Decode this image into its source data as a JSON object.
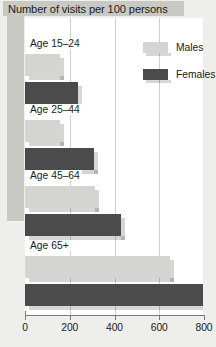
{
  "chart_data": {
    "type": "bar",
    "orientation": "horizontal",
    "title": "Number of visits per 100 persons",
    "xlabel": "",
    "ylabel": "",
    "xlim": [
      0,
      800
    ],
    "xticks": [
      0,
      200,
      400,
      600,
      800
    ],
    "xtick_labels": [
      "0",
      "200",
      "400",
      "600",
      "800"
    ],
    "grid": true,
    "legend_position": "upper right",
    "categories": [
      "Age 15–24",
      "Age 25–44",
      "Age 45–64",
      "Age 65+"
    ],
    "series": [
      {
        "name": "Males",
        "color": "#d4d4d1",
        "values": [
          155,
          155,
          315,
          650
        ]
      },
      {
        "name": "Females",
        "color": "#4b4b4b",
        "values": [
          235,
          310,
          430,
          820
        ]
      }
    ]
  },
  "legend": {
    "items": [
      {
        "label": "Males"
      },
      {
        "label": "Females"
      }
    ]
  },
  "colors": {
    "title_band": "#c9c9c4",
    "males": "#d4d4d1",
    "females": "#4b4b4b",
    "plot_bg": "#ffffff",
    "page_bg": "#eeeeec",
    "gridline": "#cfcfcf",
    "axis": "#7a7a7a"
  }
}
